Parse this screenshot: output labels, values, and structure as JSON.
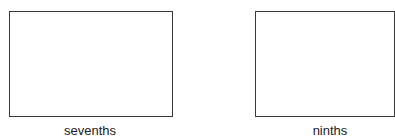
{
  "figures": [
    {
      "label": "sevenths",
      "left": 9,
      "top": 11,
      "width": 164,
      "height": 106,
      "label_left": 40,
      "label_width": 100
    },
    {
      "label": "ninths",
      "left": 255,
      "top": 11,
      "width": 140,
      "height": 106,
      "label_left": 280,
      "label_width": 100
    }
  ]
}
